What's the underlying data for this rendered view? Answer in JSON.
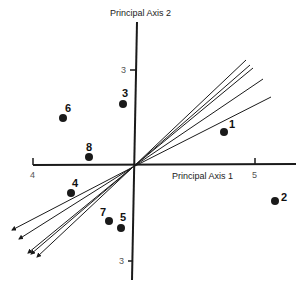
{
  "diagram": {
    "type": "biplot",
    "axes": {
      "x": {
        "label": "Principal Axis 1",
        "ticks": [
          {
            "label": "4",
            "x": 33
          },
          {
            "label": "5",
            "x": 255
          }
        ]
      },
      "y": {
        "label": "Principal Axis 2",
        "ticks": [
          {
            "label": "3",
            "y": 70,
            "side": "upper"
          },
          {
            "label": "3",
            "y": 261,
            "side": "lower"
          }
        ]
      }
    },
    "origin": {
      "x": 133,
      "y": 167
    },
    "points": [
      {
        "id": "1",
        "x": 224,
        "y": 132
      },
      {
        "id": "2",
        "x": 275,
        "y": 201
      },
      {
        "id": "3",
        "x": 123,
        "y": 104
      },
      {
        "id": "4",
        "x": 71,
        "y": 193
      },
      {
        "id": "5",
        "x": 121,
        "y": 228
      },
      {
        "id": "6",
        "x": 63,
        "y": 118
      },
      {
        "id": "7",
        "x": 109,
        "y": 221
      },
      {
        "id": "8",
        "x": 89,
        "y": 157
      }
    ],
    "vectors": [
      {
        "up": [
          246,
          60
        ],
        "down": [
          31,
          254
        ]
      },
      {
        "up": [
          250,
          65
        ],
        "down": [
          28,
          253
        ]
      },
      {
        "up": [
          253,
          68
        ],
        "down": [
          37,
          257
        ]
      },
      {
        "up": [
          263,
          79
        ],
        "down": [
          19,
          239
        ]
      },
      {
        "up": [
          271,
          97
        ],
        "down": [
          12,
          230
        ]
      }
    ],
    "colors": {
      "ink": "#1a1a1a",
      "background": "#ffffff"
    }
  }
}
